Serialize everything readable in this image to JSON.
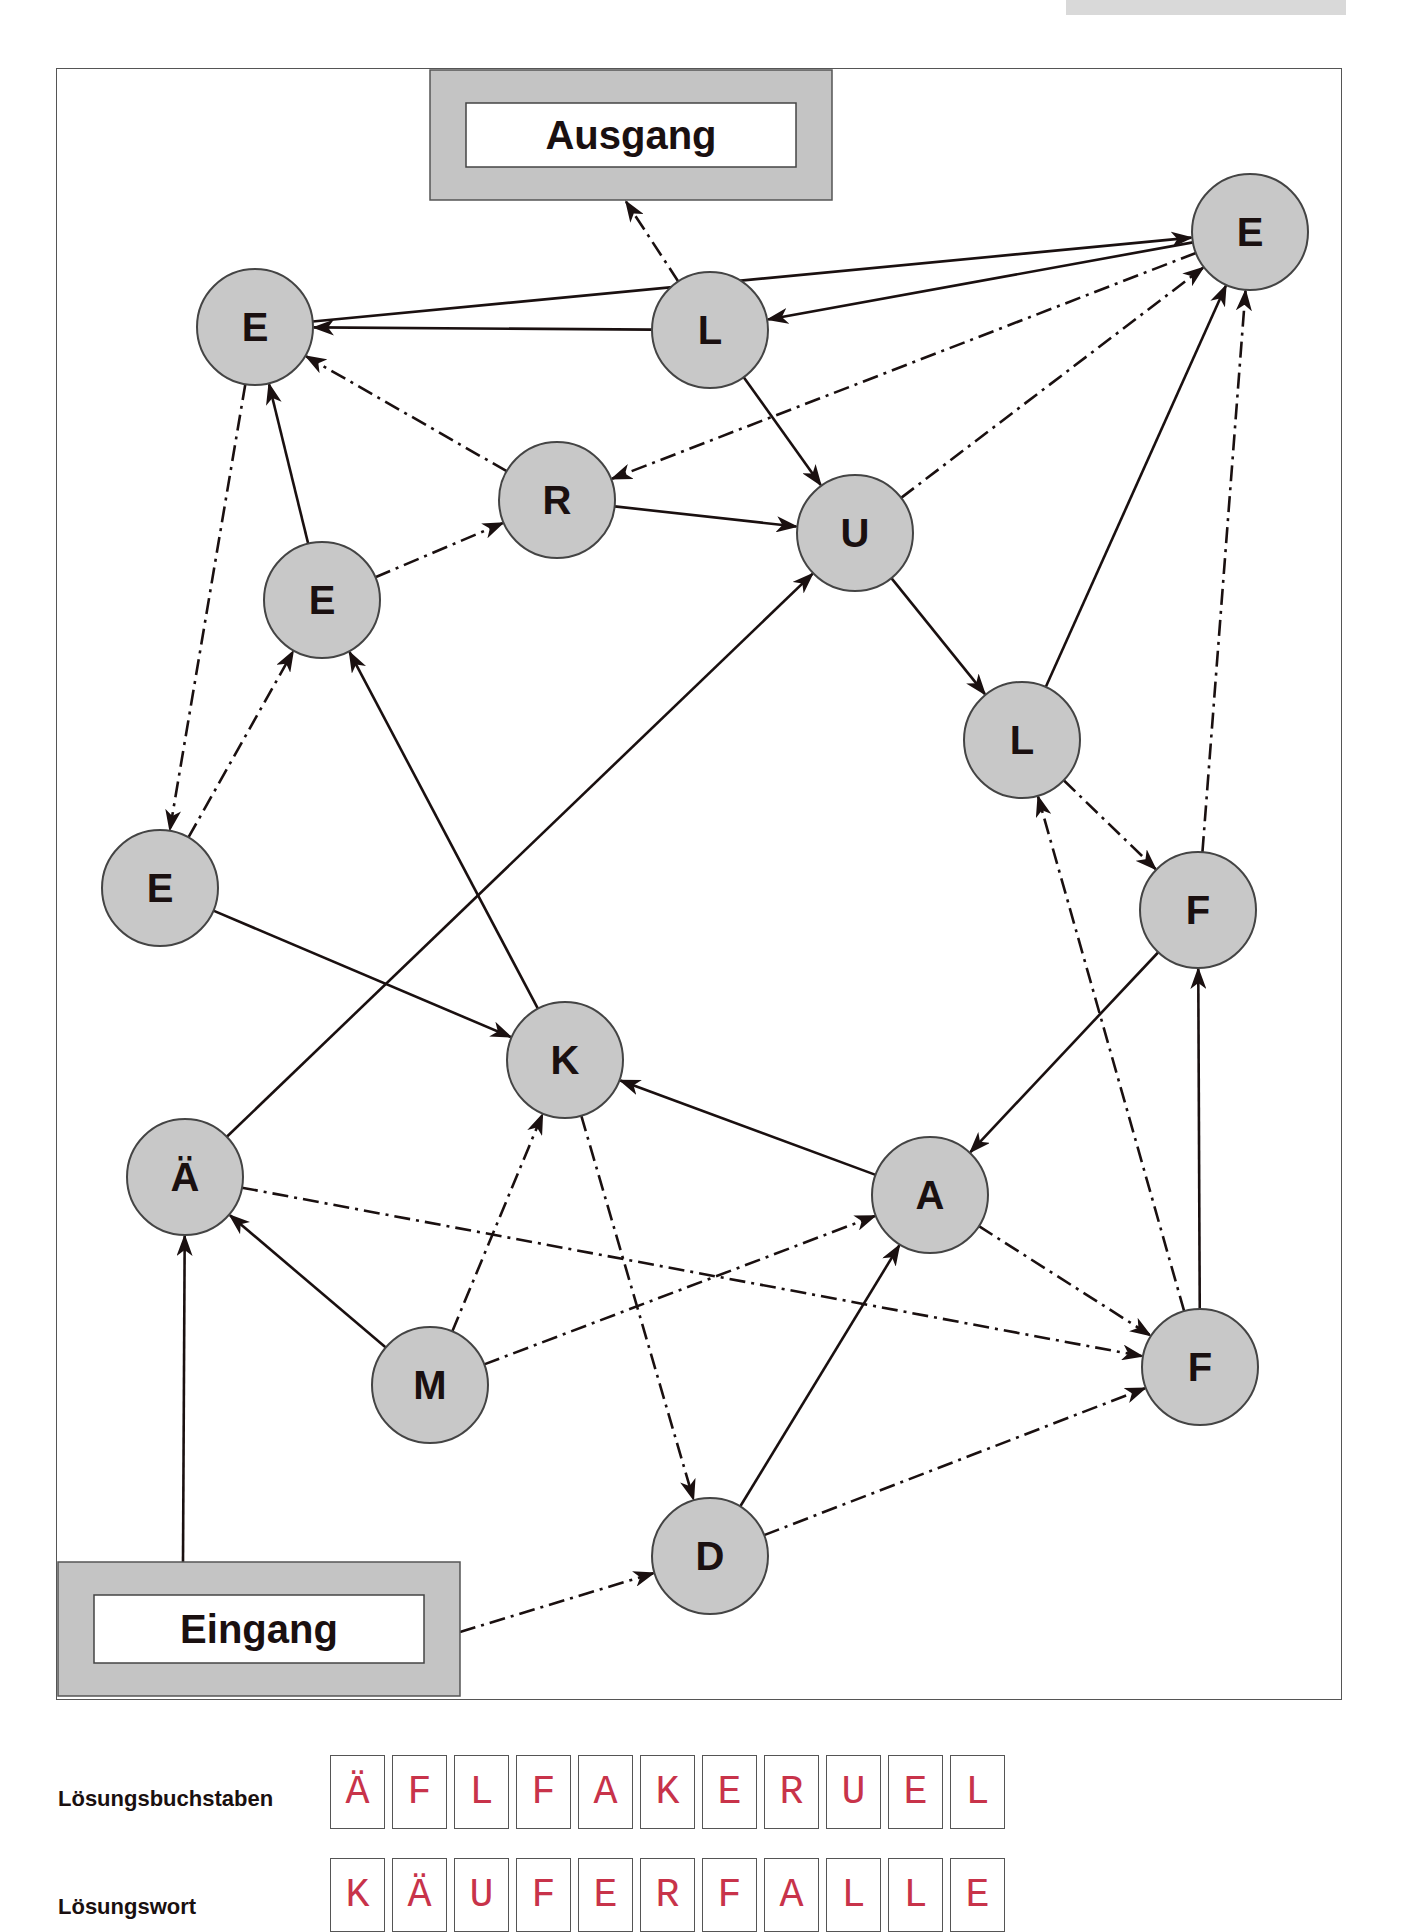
{
  "colors": {
    "node_fill": "#c8c8c8",
    "node_stroke": "#444444",
    "edge": "#1a1010",
    "gate_fill": "#c4c4c4",
    "letter_red": "#c8334a"
  },
  "gates": {
    "exit": {
      "label": "Ausgang",
      "x": 430,
      "y": 70,
      "w": 402,
      "h": 130
    },
    "entrance": {
      "label": "Eingang",
      "x": 58,
      "y": 1562,
      "w": 402,
      "h": 134
    }
  },
  "nodes": [
    {
      "id": "E1",
      "letter": "E",
      "x": 1250,
      "y": 232
    },
    {
      "id": "E2",
      "letter": "E",
      "x": 255,
      "y": 327
    },
    {
      "id": "L1",
      "letter": "L",
      "x": 710,
      "y": 330
    },
    {
      "id": "R",
      "letter": "R",
      "x": 557,
      "y": 500
    },
    {
      "id": "U",
      "letter": "U",
      "x": 855,
      "y": 533
    },
    {
      "id": "E3",
      "letter": "E",
      "x": 322,
      "y": 600
    },
    {
      "id": "L2",
      "letter": "L",
      "x": 1022,
      "y": 740
    },
    {
      "id": "E4",
      "letter": "E",
      "x": 160,
      "y": 888
    },
    {
      "id": "F1",
      "letter": "F",
      "x": 1198,
      "y": 910
    },
    {
      "id": "K",
      "letter": "K",
      "x": 565,
      "y": 1060
    },
    {
      "id": "AE",
      "letter": "Ä",
      "x": 185,
      "y": 1177
    },
    {
      "id": "A",
      "letter": "A",
      "x": 930,
      "y": 1195
    },
    {
      "id": "M",
      "letter": "M",
      "x": 430,
      "y": 1385
    },
    {
      "id": "F2",
      "letter": "F",
      "x": 1200,
      "y": 1367
    },
    {
      "id": "D",
      "letter": "D",
      "x": 710,
      "y": 1556
    }
  ],
  "edges": [
    {
      "from": "ENTRANCE_TOP",
      "to": "AE",
      "style": "solid"
    },
    {
      "from": "ENTRANCE_RIGHT",
      "to": "D",
      "style": "dashdot"
    },
    {
      "from": "AE",
      "to": "U",
      "style": "solid"
    },
    {
      "from": "AE",
      "to": "F2",
      "style": "dashdot"
    },
    {
      "from": "M",
      "to": "AE",
      "style": "solid"
    },
    {
      "from": "M",
      "to": "K",
      "style": "dashdot"
    },
    {
      "from": "M",
      "to": "A",
      "style": "dashdot"
    },
    {
      "from": "K",
      "to": "E3",
      "style": "solid"
    },
    {
      "from": "K",
      "to": "D",
      "style": "dashdot"
    },
    {
      "from": "E4",
      "to": "K",
      "style": "solid"
    },
    {
      "from": "E4",
      "to": "E3",
      "style": "dashdot"
    },
    {
      "from": "E2",
      "to": "E4",
      "style": "dashdot"
    },
    {
      "from": "E2",
      "to": "E1",
      "style": "solid"
    },
    {
      "from": "E3",
      "to": "E2",
      "style": "solid"
    },
    {
      "from": "E3",
      "to": "R",
      "style": "dashdot"
    },
    {
      "from": "R",
      "to": "E2",
      "style": "dashdot"
    },
    {
      "from": "R",
      "to": "U",
      "style": "solid"
    },
    {
      "from": "L1",
      "to": "E2",
      "style": "solid"
    },
    {
      "from": "L1",
      "to": "U",
      "style": "solid"
    },
    {
      "from": "L1",
      "to": "EXIT",
      "style": "dashdot"
    },
    {
      "from": "E1",
      "to": "L1",
      "style": "solid"
    },
    {
      "from": "E1",
      "to": "R",
      "style": "dashdot"
    },
    {
      "from": "U",
      "to": "E1",
      "style": "dashdot"
    },
    {
      "from": "U",
      "to": "L2",
      "style": "solid"
    },
    {
      "from": "L2",
      "to": "E1",
      "style": "solid"
    },
    {
      "from": "L2",
      "to": "F1",
      "style": "dashdot"
    },
    {
      "from": "F1",
      "to": "E1",
      "style": "dashdot"
    },
    {
      "from": "F1",
      "to": "A",
      "style": "solid"
    },
    {
      "from": "A",
      "to": "K",
      "style": "solid"
    },
    {
      "from": "A",
      "to": "F2",
      "style": "dashdot"
    },
    {
      "from": "F2",
      "to": "F1",
      "style": "solid"
    },
    {
      "from": "F2",
      "to": "L2",
      "style": "dashdot"
    },
    {
      "from": "D",
      "to": "A",
      "style": "solid"
    },
    {
      "from": "D",
      "to": "F2",
      "style": "dashdot"
    }
  ],
  "solution": {
    "letters_label": "Lösungsbuchstaben",
    "letters": [
      "Ä",
      "F",
      "L",
      "F",
      "A",
      "K",
      "E",
      "R",
      "U",
      "E",
      "L"
    ],
    "word_label": "Lösungswort",
    "word": [
      "K",
      "Ä",
      "U",
      "F",
      "E",
      "R",
      "F",
      "A",
      "L",
      "L",
      "E"
    ]
  }
}
